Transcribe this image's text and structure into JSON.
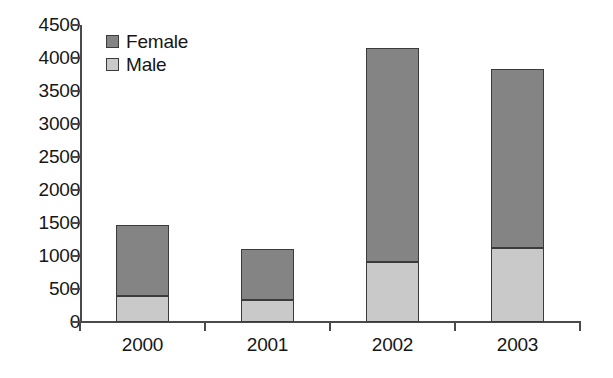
{
  "chart_data": {
    "type": "bar",
    "subtype": "stacked-vertical",
    "title": "",
    "subtitle": "",
    "xlabel": "",
    "ylabel": "",
    "categories": [
      "2000",
      "2001",
      "2002",
      "2003"
    ],
    "series": [
      {
        "name": "Male",
        "values": [
          400,
          330,
          910,
          1120
        ],
        "color": "#c9c9c9"
      },
      {
        "name": "Female",
        "values": [
          1070,
          780,
          3240,
          2710
        ],
        "color": "#848484"
      }
    ],
    "totals": [
      1470,
      1110,
      4150,
      3830
    ],
    "ylim": [
      0,
      4500
    ],
    "yticks": [
      0,
      500,
      1000,
      1500,
      2000,
      2500,
      3000,
      3500,
      4000,
      4500
    ],
    "ytick_labels": [
      "0",
      "500",
      "1000",
      "1500",
      "2000",
      "2500",
      "3000",
      "3500",
      "4000",
      "4500"
    ],
    "grid": false,
    "legend": {
      "position": "top-left-inside",
      "entries": [
        {
          "label": "Female",
          "color": "#848484"
        },
        {
          "label": "Male",
          "color": "#c9c9c9"
        }
      ]
    },
    "axis_color": "#4a4a4a",
    "background": "#ffffff"
  }
}
